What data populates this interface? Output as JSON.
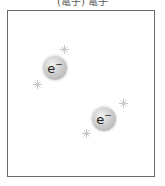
{
  "caption": "(電子) 電子",
  "electrons": [
    {
      "label": "e",
      "charge": "−"
    },
    {
      "label": "e",
      "charge": "−"
    }
  ],
  "colors": {
    "frame": "#6a6a6a",
    "electron": "#bdbdbd",
    "spark": "#c8c8c8"
  }
}
